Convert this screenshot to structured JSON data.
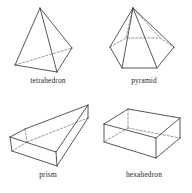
{
  "figure": {
    "background_color": "#ffffff",
    "line_color": "#3a3a3a",
    "hidden_line_color": "#6e6e6e",
    "caption_color": "#262626",
    "layout": "2x2 grid of labeled wireframe solids"
  },
  "solids": [
    {
      "id": "tetrahedron",
      "label": "tetrahedron",
      "position": "top-left",
      "faces": 4,
      "vertices": 4,
      "edges": 6,
      "base_shape": "triangle",
      "hidden_edges": 1
    },
    {
      "id": "pyramid",
      "label": "pyramid",
      "position": "top-right",
      "faces": 7,
      "vertices": 7,
      "edges": 12,
      "base_shape": "hexagon",
      "hidden_edges": 3
    },
    {
      "id": "prism",
      "label": "prism",
      "position": "bottom-left",
      "faces": 6,
      "vertices": 8,
      "edges": 12,
      "base_shape": "rectangle",
      "hidden_edges": 3
    },
    {
      "id": "hexahedron",
      "label": "hexahedron",
      "position": "bottom-right",
      "faces": 6,
      "vertices": 8,
      "edges": 12,
      "base_shape": "rectangle",
      "hidden_edges": 3
    }
  ]
}
